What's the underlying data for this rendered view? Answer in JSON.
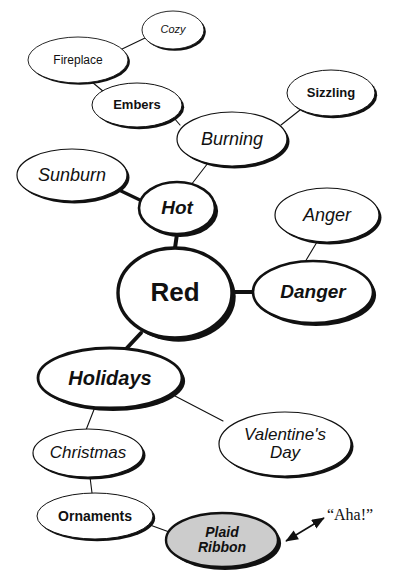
{
  "diagram": {
    "type": "mind-map",
    "title_node": "Red",
    "background": "#ffffff",
    "ink_color": "#111111",
    "highlight_fill": "#cccccc"
  },
  "nodes": [
    {
      "id": "red",
      "label": "Red",
      "level": 0,
      "cx": 175,
      "cy": 293,
      "rx": 57,
      "ry": 45,
      "font_size": 26,
      "bold": true,
      "italic": false,
      "stroke": 3.4,
      "shadow": 6,
      "fill": "#ffffff"
    },
    {
      "id": "hot",
      "label": "Hot",
      "level": 1,
      "cx": 177,
      "cy": 208,
      "rx": 38,
      "ry": 26,
      "font_size": 19,
      "bold": true,
      "italic": true,
      "stroke": 2.6,
      "shadow": 5,
      "fill": "#ffffff"
    },
    {
      "id": "danger",
      "label": "Danger",
      "level": 1,
      "cx": 313,
      "cy": 292,
      "rx": 60,
      "ry": 31,
      "font_size": 19,
      "bold": true,
      "italic": true,
      "stroke": 2.6,
      "shadow": 5,
      "fill": "#ffffff"
    },
    {
      "id": "holidays",
      "label": "Holidays",
      "level": 1,
      "cx": 110,
      "cy": 378,
      "rx": 72,
      "ry": 30,
      "font_size": 20,
      "bold": true,
      "italic": true,
      "stroke": 2.8,
      "shadow": 5,
      "fill": "#ffffff"
    },
    {
      "id": "burning",
      "label": "Burning",
      "level": 2,
      "cx": 232,
      "cy": 139,
      "rx": 55,
      "ry": 27,
      "font_size": 18,
      "bold": false,
      "italic": true,
      "stroke": 1.2,
      "shadow": 4,
      "fill": "#ffffff"
    },
    {
      "id": "sunburn",
      "label": "Sunburn",
      "level": 2,
      "cx": 72,
      "cy": 175,
      "rx": 55,
      "ry": 26,
      "font_size": 18,
      "bold": false,
      "italic": true,
      "stroke": 1.2,
      "shadow": 4,
      "fill": "#ffffff"
    },
    {
      "id": "anger",
      "label": "Anger",
      "level": 2,
      "cx": 327,
      "cy": 215,
      "rx": 52,
      "ry": 27,
      "font_size": 18,
      "bold": false,
      "italic": true,
      "stroke": 1.2,
      "shadow": 4,
      "fill": "#ffffff"
    },
    {
      "id": "christmas",
      "label": "Christmas",
      "level": 2,
      "cx": 88,
      "cy": 453,
      "rx": 55,
      "ry": 24,
      "font_size": 17,
      "bold": false,
      "italic": true,
      "stroke": 1.2,
      "shadow": 4,
      "fill": "#ffffff"
    },
    {
      "id": "valentines",
      "label": "Valentine's\nDay",
      "level": 2,
      "cx": 285,
      "cy": 444,
      "rx": 66,
      "ry": 32,
      "font_size": 17,
      "bold": false,
      "italic": true,
      "stroke": 1.2,
      "shadow": 4,
      "fill": "#ffffff"
    },
    {
      "id": "sizzling",
      "label": "Sizzling",
      "level": 3,
      "cx": 331,
      "cy": 93,
      "rx": 44,
      "ry": 23,
      "font_size": 13,
      "bold": true,
      "italic": false,
      "stroke": 1.0,
      "shadow": 3.5,
      "fill": "#ffffff"
    },
    {
      "id": "embers",
      "label": "Embers",
      "level": 3,
      "cx": 137,
      "cy": 105,
      "rx": 45,
      "ry": 22,
      "font_size": 13,
      "bold": true,
      "italic": false,
      "stroke": 1.0,
      "shadow": 3.5,
      "fill": "#ffffff"
    },
    {
      "id": "ornaments",
      "label": "Ornaments",
      "level": 3,
      "cx": 95,
      "cy": 516,
      "rx": 58,
      "ry": 23,
      "font_size": 14,
      "bold": true,
      "italic": false,
      "stroke": 1.0,
      "shadow": 3.5,
      "fill": "#ffffff"
    },
    {
      "id": "fireplace",
      "label": "Fireplace",
      "level": 4,
      "cx": 78,
      "cy": 60,
      "rx": 50,
      "ry": 23,
      "font_size": 12,
      "bold": false,
      "italic": false,
      "stroke": 0.9,
      "shadow": 3,
      "fill": "#ffffff"
    },
    {
      "id": "cozy",
      "label": "Cozy",
      "level": 4,
      "cx": 173,
      "cy": 30,
      "rx": 31,
      "ry": 19,
      "font_size": 11,
      "bold": false,
      "italic": true,
      "stroke": 0.9,
      "shadow": 3,
      "fill": "#ffffff"
    },
    {
      "id": "plaid",
      "label": "Plaid\nRibbon",
      "level": 3,
      "cx": 222,
      "cy": 540,
      "rx": 56,
      "ry": 27,
      "font_size": 14,
      "bold": true,
      "italic": true,
      "stroke": 2.4,
      "shadow": 5,
      "fill": "#cccccc"
    }
  ],
  "edges": [
    {
      "from": "red",
      "to": "hot",
      "x1": 175,
      "y1": 248,
      "x2": 177,
      "y2": 234,
      "width": 4.0
    },
    {
      "from": "red",
      "to": "danger",
      "x1": 231,
      "y1": 292,
      "x2": 254,
      "y2": 292,
      "width": 4.0
    },
    {
      "from": "red",
      "to": "holidays",
      "x1": 141,
      "y1": 333,
      "x2": 126,
      "y2": 349,
      "width": 4.0
    },
    {
      "from": "hot",
      "to": "sunburn",
      "x1": 142,
      "y1": 201,
      "x2": 119,
      "y2": 190,
      "width": 3.2
    },
    {
      "from": "hot",
      "to": "burning",
      "x1": 191,
      "y1": 185,
      "x2": 208,
      "y2": 163,
      "width": 1.1
    },
    {
      "from": "burning",
      "to": "sizzling",
      "x1": 281,
      "y1": 125,
      "x2": 300,
      "y2": 110,
      "width": 1.1
    },
    {
      "from": "burning",
      "to": "embers",
      "x1": 180,
      "y1": 125,
      "x2": 174,
      "y2": 118,
      "width": 1.1
    },
    {
      "from": "embers",
      "to": "fireplace",
      "x1": 104,
      "y1": 92,
      "x2": 92,
      "y2": 82,
      "width": 1.1
    },
    {
      "from": "fireplace",
      "to": "cozy",
      "x1": 120,
      "y1": 50,
      "x2": 145,
      "y2": 38,
      "width": 1.1
    },
    {
      "from": "danger",
      "to": "anger",
      "x1": 305,
      "y1": 262,
      "x2": 317,
      "y2": 242,
      "width": 1.1
    },
    {
      "from": "holidays",
      "to": "christmas",
      "x1": 95,
      "y1": 407,
      "x2": 86,
      "y2": 430,
      "width": 1.1
    },
    {
      "from": "holidays",
      "to": "valentines",
      "x1": 175,
      "y1": 396,
      "x2": 223,
      "y2": 421,
      "width": 1.1
    },
    {
      "from": "christmas",
      "to": "ornaments",
      "x1": 90,
      "y1": 477,
      "x2": 92,
      "y2": 493,
      "width": 1.1
    },
    {
      "from": "ornaments",
      "to": "plaid",
      "x1": 150,
      "y1": 525,
      "x2": 172,
      "y2": 533,
      "width": 1.1
    }
  ],
  "annotation": {
    "id": "aha",
    "text": "“Aha!”",
    "x": 350,
    "y": 515,
    "arrow": {
      "x1": 286,
      "y1": 541,
      "x2": 324,
      "y2": 518,
      "double_headed": true,
      "width": 1.6
    }
  }
}
